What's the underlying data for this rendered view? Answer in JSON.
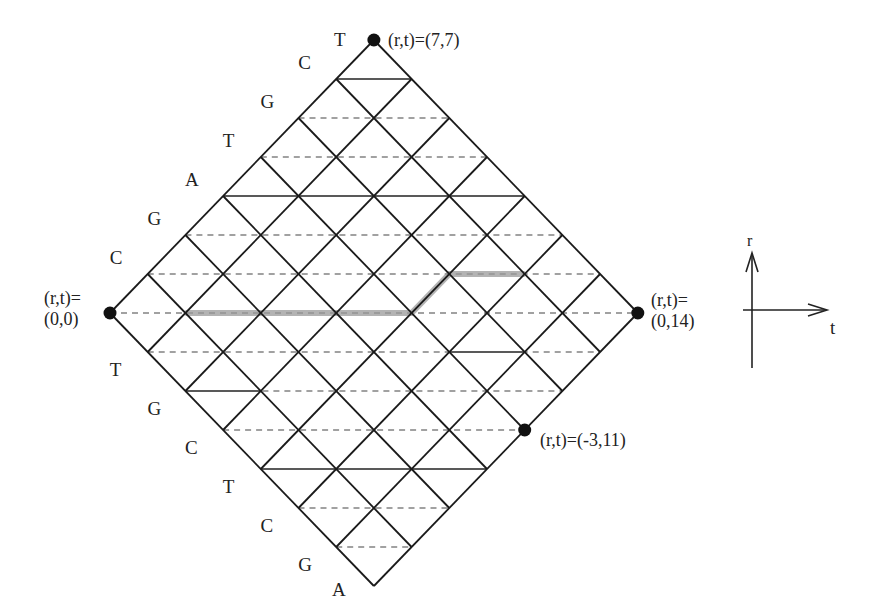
{
  "diagram": {
    "grid": {
      "t_max": 14,
      "r_max": 7,
      "origin_px": [
        110,
        313
      ],
      "dx": 37.7,
      "dy": 39.0
    },
    "left_upper_sequence": [
      {
        "r": 7,
        "letter": "T"
      },
      {
        "r": 6,
        "letter": "C"
      },
      {
        "r": 5,
        "letter": "G"
      },
      {
        "r": 4,
        "letter": "T"
      },
      {
        "r": 3,
        "letter": "A"
      },
      {
        "r": 2,
        "letter": "G"
      },
      {
        "r": 1,
        "letter": "C"
      }
    ],
    "left_lower_sequence": [
      {
        "r": -1,
        "letter": "T"
      },
      {
        "r": -2,
        "letter": "G"
      },
      {
        "r": -3,
        "letter": "C"
      },
      {
        "r": -4,
        "letter": "T"
      },
      {
        "r": -5,
        "letter": "C"
      },
      {
        "r": -6,
        "letter": "G"
      },
      {
        "r": -7,
        "letter": "A"
      }
    ],
    "solid_horizontal_segments": [
      {
        "r": 6,
        "t_from": 6,
        "t_to": 8
      },
      {
        "r": 3,
        "t_from": 3,
        "t_to": 11
      },
      {
        "r": -1,
        "t_from": 9,
        "t_to": 11
      },
      {
        "r": -2,
        "t_from": 2,
        "t_to": 4
      },
      {
        "r": -4,
        "t_from": 4,
        "t_to": 10
      }
    ],
    "highlight_path": [
      [
        0,
        2
      ],
      [
        0,
        8
      ],
      [
        1,
        9
      ],
      [
        1,
        11
      ]
    ],
    "highlight_color": "#9a9a9a",
    "points": [
      {
        "id": "top",
        "r": 7,
        "t": 7,
        "label": "(r,t)=(7,7)"
      },
      {
        "id": "left",
        "r": 0,
        "t": 0,
        "label_line1": "(r,t)=",
        "label_line2": "(0,0)"
      },
      {
        "id": "right",
        "r": 0,
        "t": 14,
        "label_line1": "(r,t)=",
        "label_line2": "(0,14)"
      },
      {
        "id": "lower-right",
        "r": -3,
        "t": 11,
        "label": "(r,t)=(-3,11)"
      }
    ],
    "axes_legend": {
      "vertical_label": "r",
      "horizontal_label": "t"
    }
  }
}
